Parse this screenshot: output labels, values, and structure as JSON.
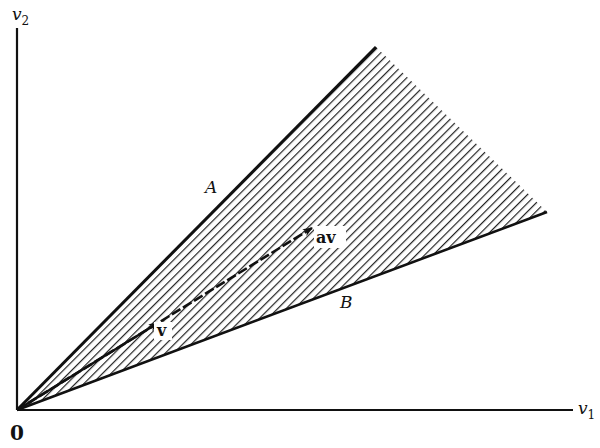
{
  "diagram": {
    "axes": {
      "x_label": "v",
      "x_subscript": "1",
      "y_label": "v",
      "y_subscript": "2",
      "origin_label": "0"
    },
    "rays": [
      {
        "id": "A",
        "label": "A"
      },
      {
        "id": "B",
        "label": "B"
      }
    ],
    "vectors": [
      {
        "id": "v",
        "label": "v"
      },
      {
        "id": "av",
        "label": "av"
      }
    ],
    "shading": "diagonal hatching",
    "colors": {
      "ink": "#111111",
      "background": "#ffffff"
    }
  }
}
